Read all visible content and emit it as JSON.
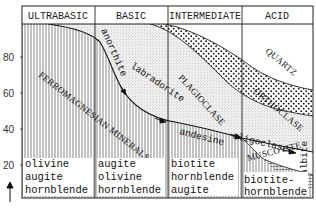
{
  "diagram": {
    "type": "igneous rock mineral composition (Bowen's series)",
    "header": {
      "columns": [
        {
          "label": "ULTRABASIC"
        },
        {
          "label": "BASIC"
        },
        {
          "label": "INTERMEDIATE"
        },
        {
          "label": "ACID"
        }
      ]
    },
    "y_axis": {
      "ticks": [
        "80",
        "60",
        "40",
        "20"
      ],
      "arrow": "up-arrow"
    },
    "regions": {
      "ferromagnesian": "FERROMAGNESIAN MINERALS",
      "plagioclase": "PLAGIOCLASE",
      "orthoclase": "ORTHOCLASE",
      "quartz": "QUARTZ",
      "muscovite": "MUSCOVITE",
      "albite": "albite"
    },
    "plagioclase_series": [
      "anorthite",
      "labradorite",
      "andesine",
      "oligoclase"
    ],
    "bottom_minerals": [
      {
        "lines": [
          "olivine",
          "augite",
          "hornblende"
        ]
      },
      {
        "lines": [
          "augite",
          "olivine",
          "hornblende"
        ]
      },
      {
        "lines": [
          "biotite",
          "hornblende",
          "augite"
        ]
      },
      {
        "lines": [
          "biotite-",
          "hornblende"
        ]
      }
    ],
    "colors": {
      "ink": "#222222",
      "background": "#ffffff",
      "stipple_light": "#9a9a9a",
      "stipple_dark": "#111111"
    }
  }
}
